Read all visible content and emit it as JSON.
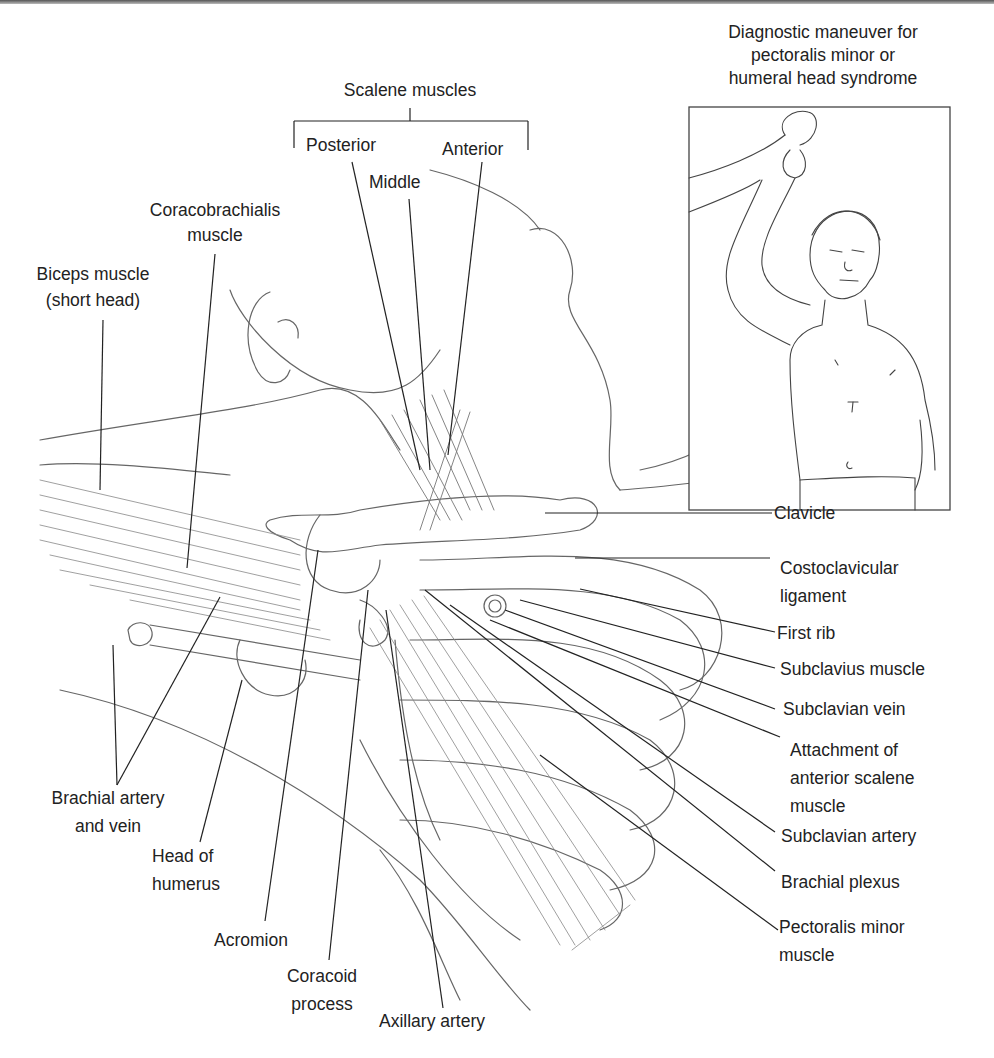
{
  "figure": {
    "inset": {
      "caption_lines": [
        "Diagnostic maneuver for",
        "pectoralis minor or",
        "humeral head syndrome"
      ],
      "figure_name": "patient-with-arm-raised"
    },
    "scalene": {
      "group_label": "Scalene muscles",
      "posterior": "Posterior",
      "middle": "Middle",
      "anterior": "Anterior"
    },
    "left_labels": {
      "coracobrachialis": [
        "Coracobrachialis",
        "muscle"
      ],
      "biceps": [
        "Biceps muscle",
        "(short head)"
      ],
      "brachial_artery_vein": [
        "Brachial artery",
        "and vein"
      ],
      "head_of_humerus": [
        "Head of",
        "humerus"
      ],
      "acromion": "Acromion",
      "coracoid": [
        "Coracoid",
        "process"
      ],
      "axillary_artery": "Axillary artery"
    },
    "right_labels": {
      "clavicle": "Clavicle",
      "costoclavicular": [
        "Costoclavicular",
        "ligament"
      ],
      "first_rib": "First rib",
      "subclavius": "Subclavius muscle",
      "subclavian_vein": "Subclavian vein",
      "attachment_anterior_scalene": [
        "Attachment of",
        "anterior scalene",
        "muscle"
      ],
      "subclavian_artery": "Subclavian artery",
      "brachial_plexus": "Brachial plexus",
      "pectoralis_minor": [
        "Pectoralis minor",
        "muscle"
      ]
    },
    "colors": {
      "line": "#222222",
      "art": "#666666",
      "background": "#ffffff"
    }
  }
}
